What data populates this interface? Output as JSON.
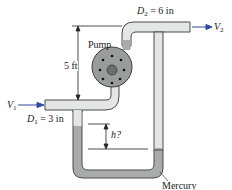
{
  "diagram": {
    "type": "pump-with-mercury-manometer",
    "labels": {
      "d2_var": "D",
      "d2_sub": "2",
      "d2_value": " = 6 in",
      "v2_var": "V",
      "v2_sub": "2",
      "pump": "Pump",
      "height": "5 ft",
      "v1_var": "V",
      "v1_sub": "1",
      "d1_var": "D",
      "d1_sub": "1",
      "d1_value": " = 3 in",
      "h": "h?",
      "mercury": "Mercury"
    },
    "colors": {
      "pipe_fill": "#e4e6e6",
      "pipe_wall": "#4a4a4a",
      "mercury": "#a9abab",
      "pump_fill": "#9a9c9c",
      "arrow": "#2b4aa0",
      "line": "#222222"
    }
  }
}
